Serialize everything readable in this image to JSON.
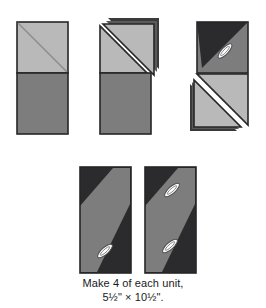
{
  "figure": {
    "kind": "quilting-piecing-instruction-diagram",
    "background_color": "#ffffff",
    "caption": {
      "line1": "Make 4 of each unit,",
      "line2": "5½\" × 10½\"."
    }
  },
  "palette": {
    "light_gray": "#b9b9b9",
    "light_gray_shadow": "#a8a8a8",
    "medium_gray": "#7d7d7d",
    "medium_gray_alt": "#7a7a7a",
    "dark_gray": "#2b2b2d",
    "outline": "#262626",
    "white": "#ffffff",
    "stitch": "#3a3a3a",
    "pin_fill": "#ffffff",
    "pin_outline": "#4a4a4a"
  },
  "steps": [
    {
      "id": "step-1",
      "name": "two-squares-stacked",
      "description": "Light gray square with drawn diagonal line above a medium gray square",
      "x": 17,
      "y": 22,
      "width": 51,
      "height": 112,
      "parts": [
        {
          "name": "top-square-light",
          "fill": "light_gray",
          "marking": "drawn-diagonal-line"
        },
        {
          "name": "bottom-square-medium",
          "fill": "medium_gray",
          "marking": "none"
        }
      ]
    },
    {
      "id": "step-2",
      "name": "triangle-flipped-open-light",
      "description": "Top square sewn on the diagonal and the corner triangle flipped open, stitching line shown",
      "x": 100,
      "y": 22,
      "width": 51,
      "height": 112,
      "parts": [
        {
          "name": "flipped-triangle-light",
          "fill": "light_gray",
          "marking": "none"
        },
        {
          "name": "base-triangle-light",
          "fill": "light_gray",
          "marking": "stitch-line"
        },
        {
          "name": "bottom-square-medium",
          "fill": "medium_gray",
          "marking": "none"
        }
      ]
    },
    {
      "id": "step-3",
      "name": "dark-square-pinned-and-triangle-flipped",
      "description": "Dark and medium gray half square triangle unit pinned, lower light gray triangle flipped open with stitching line",
      "x": 197,
      "y": 22,
      "width": 51,
      "height": 112,
      "parts": [
        {
          "name": "top-left-triangle-dark",
          "fill": "dark_gray",
          "marking": "none"
        },
        {
          "name": "bottom-right-triangle-medium",
          "fill": "medium_gray",
          "marking": "none"
        },
        {
          "name": "pin",
          "count": 1
        },
        {
          "name": "base-triangle-light",
          "fill": "light_gray",
          "marking": "stitch-line"
        },
        {
          "name": "flipped-triangle-light",
          "fill": "light_gray",
          "marking": "none"
        }
      ]
    },
    {
      "id": "step-4",
      "name": "finished-unit-left",
      "description": "Finished pieced unit, dark background with medium gray diagonal band, one pin",
      "x": 80,
      "y": 167,
      "width": 51,
      "height": 106,
      "parts": [
        {
          "name": "background-dark",
          "fill": "dark_gray"
        },
        {
          "name": "diagonal-band-medium",
          "fill": "medium_gray"
        },
        {
          "name": "pin",
          "count": 1
        }
      ]
    },
    {
      "id": "step-5",
      "name": "finished-unit-right",
      "description": "Finished pieced unit, dark background with medium gray diagonal band, two pins",
      "x": 145,
      "y": 167,
      "width": 51,
      "height": 106,
      "parts": [
        {
          "name": "background-dark",
          "fill": "dark_gray"
        },
        {
          "name": "diagonal-band-medium",
          "fill": "medium_gray"
        },
        {
          "name": "pin",
          "count": 2
        }
      ]
    }
  ]
}
